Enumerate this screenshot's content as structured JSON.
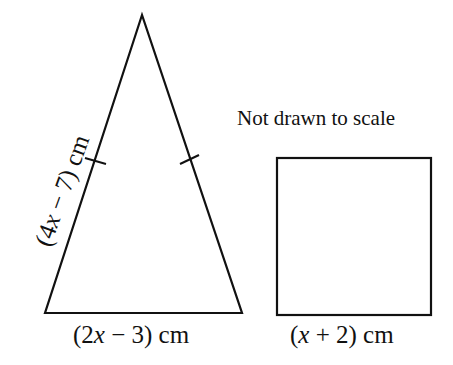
{
  "diagram": {
    "note": "Not drawn to scale",
    "triangle": {
      "type": "isosceles",
      "side_label": "(4x − 7) cm",
      "side_label_parts": [
        "(4",
        "x",
        " − 7) cm"
      ],
      "base_label": "(2x − 3) cm",
      "base_label_parts": [
        "(2",
        "x",
        " − 3) cm"
      ],
      "equal_sides_marked": true
    },
    "square": {
      "side_label": "(x + 2) cm",
      "side_label_parts": [
        "(",
        "x",
        " + 2) cm"
      ]
    },
    "colors": {
      "stroke": "#111111",
      "background": "#ffffff"
    }
  }
}
